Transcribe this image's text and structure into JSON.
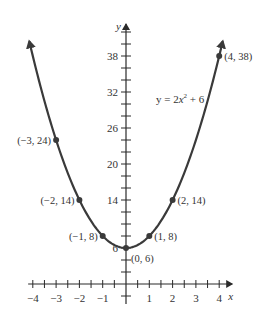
{
  "chart_data": {
    "type": "line",
    "title": "",
    "equation": "y = 2x² + 6",
    "equation_parts": {
      "lhs": "y = 2",
      "var": "x",
      "exp": "2",
      "rhs": " + 6"
    },
    "xlabel": "x",
    "ylabel": "y",
    "xlim": [
      -4.2,
      4.3
    ],
    "ylim": [
      -3,
      43
    ],
    "x_ticks_minor_step": 0.5,
    "y_ticks_minor_step": 2,
    "x_tick_labels": [
      {
        "value": -4,
        "label": "−4"
      },
      {
        "value": -3,
        "label": "−3"
      },
      {
        "value": -2,
        "label": "−2"
      },
      {
        "value": -1,
        "label": "−1"
      },
      {
        "value": 1,
        "label": "1"
      },
      {
        "value": 2,
        "label": "2"
      },
      {
        "value": 3,
        "label": "3"
      },
      {
        "value": 4,
        "label": "4"
      }
    ],
    "y_tick_labels": [
      {
        "value": 6,
        "label": "6"
      },
      {
        "value": 14,
        "label": "14"
      },
      {
        "value": 20,
        "label": "20"
      },
      {
        "value": 26,
        "label": "26"
      },
      {
        "value": 32,
        "label": "32"
      },
      {
        "value": 38,
        "label": "38"
      }
    ],
    "curve": {
      "a": 2,
      "b": 0,
      "c": 6,
      "x_range": [
        -4.15,
        4.15
      ]
    },
    "points": [
      {
        "x": -3,
        "y": 24,
        "label": "(−3, 24)",
        "side": "left"
      },
      {
        "x": -2,
        "y": 14,
        "label": "(−2, 14)",
        "side": "left"
      },
      {
        "x": -1,
        "y": 8,
        "label": "(−1, 8)",
        "side": "left"
      },
      {
        "x": 0,
        "y": 6,
        "label": "(0, 6)",
        "side": "below-right"
      },
      {
        "x": 1,
        "y": 8,
        "label": "(1, 8)",
        "side": "right"
      },
      {
        "x": 2,
        "y": 14,
        "label": "(2, 14)",
        "side": "right"
      },
      {
        "x": 4,
        "y": 38,
        "label": "(4, 38)",
        "side": "right"
      }
    ],
    "grid": false,
    "legend": "none"
  }
}
